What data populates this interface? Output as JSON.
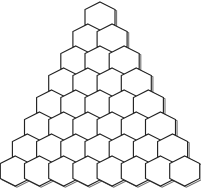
{
  "figure": {
    "shape_name": "hexagon-pyramid",
    "background_color": "#ffffff",
    "stroke_color": "#222222",
    "shadow_stroke_color": "#555555",
    "fill_color": "#ffffff",
    "stroke_width": 1.15,
    "canvas": {
      "width": 201,
      "height": 191
    }
  },
  "chart_data": {
    "type": "diagram",
    "subtitle": "",
    "xlabel": "",
    "ylabel": "",
    "orientation": "pointy-top",
    "rows": 8,
    "total_cells": 36,
    "counts_per_row": [
      1,
      2,
      3,
      4,
      5,
      6,
      7,
      8
    ],
    "geometry": {
      "hex_width": 30.0,
      "hex_height": 30.0,
      "horizontal_pitch": 24.2,
      "vertical_pitch": 22.0,
      "apex_x": 100.0,
      "apex_y": 17.0,
      "shadow_offset_x": 1.6,
      "shadow_offset_y": 1.2
    },
    "legend": [],
    "annotations": []
  }
}
